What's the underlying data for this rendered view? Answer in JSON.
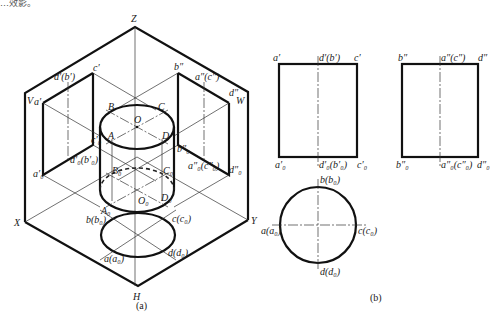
{
  "header_fragment": "…效影。",
  "figure_a": {
    "caption": "(a)",
    "axes": {
      "z": "Z",
      "x": "X",
      "y": "Y"
    },
    "planes": {
      "v": "V",
      "h": "H",
      "w": "W"
    },
    "v_plane_labels": {
      "a": "a′",
      "db": "d′(b′)",
      "c": "c′",
      "a0": "a′₀",
      "d0b0": "d′₀(b′₀)",
      "c0": "c′₀"
    },
    "w_plane_labels": {
      "b": "b″",
      "ac": "a″(c″)",
      "d": "d″",
      "b0": "b″₀",
      "a0c0": "a″₀(c″₀)",
      "d0": "d″₀"
    },
    "cylinder_labels": {
      "A": "A",
      "B": "B",
      "C": "C",
      "D": "D",
      "O": "O",
      "A0": "A₀",
      "B0": "B₀",
      "C0": "C₀",
      "D0": "D₀",
      "O0": "O₀"
    },
    "h_plane_labels": {
      "bb0": "b(b₀)",
      "cc0": "c(c₀)",
      "aa0": "a(a₀)",
      "dd0": "d(d₀)"
    }
  },
  "figure_b": {
    "caption": "(b)",
    "front_view": {
      "a": "a′",
      "db": "d′(b′)",
      "c": "c′",
      "a0": "a′₀",
      "d0b0": "d′₀(b′₀)",
      "c0": "c′₀"
    },
    "side_view": {
      "b": "b″",
      "ac": "a″(c″)",
      "d": "d″",
      "b0": "b″₀",
      "a0c0": "a″₀(c″₀)",
      "d0": "d″₀"
    },
    "top_view": {
      "bb0": "b(b₀)",
      "aa0": "a(a₀)",
      "cc0": "c(c₀)",
      "dd0": "d(d₀)"
    }
  },
  "colors": {
    "line": "#111111",
    "background": "#ffffff"
  }
}
